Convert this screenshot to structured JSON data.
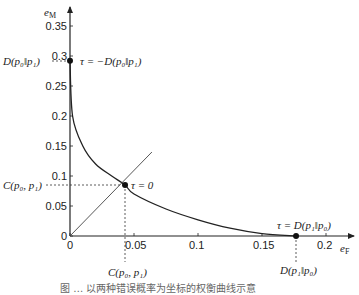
{
  "chart_data": {
    "type": "line",
    "title": "",
    "xlabel": "e_F",
    "ylabel": "e_M",
    "xlim": [
      0,
      0.22
    ],
    "ylim": [
      0,
      0.38
    ],
    "grid": false,
    "x_ticks": [
      0,
      0.05,
      0.1,
      0.15,
      0.2
    ],
    "y_ticks": [
      0,
      0.05,
      0.1,
      0.15,
      0.2,
      0.25,
      0.3,
      0.35
    ],
    "x_tick_labels": [
      "0",
      "0.05",
      "0.1",
      "0.15",
      "0.2"
    ],
    "y_tick_labels": [
      "0",
      "0.05",
      "0.1",
      "0.15",
      "0.2",
      "0.25",
      "0.3",
      "0.35"
    ],
    "series": [
      {
        "name": "tradeoff-curve",
        "x": [
          0,
          0.002,
          0.01,
          0.02,
          0.0326,
          0.043,
          0.05,
          0.075,
          0.1,
          0.125,
          0.15,
          0.1766
        ],
        "y": [
          0.292,
          0.2,
          0.15,
          0.12,
          0.1,
          0.085,
          0.07,
          0.045,
          0.027,
          0.013,
          0.004,
          0
        ]
      },
      {
        "name": "diagonal-eM-equals-eF",
        "x": [
          0,
          0.064
        ],
        "y": [
          0,
          0.14
        ]
      }
    ],
    "points": [
      {
        "name": "tau-minus-D",
        "x": 0,
        "y": 0.292,
        "label": "τ = −D(p₀‖p₁)"
      },
      {
        "name": "tau-zero",
        "x": 0.043,
        "y": 0.085,
        "label": "τ = 0"
      },
      {
        "name": "tau-plus-D",
        "x": 0.1766,
        "y": 0,
        "label": "τ = D(p₁‖p₀)"
      }
    ],
    "annotations": [
      {
        "text": "D(p₀‖p₁)",
        "position": "y-axis at 0.292"
      },
      {
        "text": "C(p₀, p₁)",
        "position": "y-axis at 0.085"
      },
      {
        "text": "C(p₀, p₁)",
        "position": "x-axis at 0.043"
      },
      {
        "text": "D(p₁‖p₀)",
        "position": "x-axis at 0.1766"
      }
    ]
  },
  "labels": {
    "xlabel_main": "e",
    "xlabel_sub": "F",
    "ylabel_main": "e",
    "ylabel_sub": "M",
    "tau_minus": "τ = −D(p₀‖p₁)",
    "tau_zero": "τ = 0",
    "tau_plus": "τ = D(p₁‖p₀)",
    "d01_y": "D(p₀‖p₁)",
    "c_y": "C(p₀, p₁)",
    "c_x": "C(p₀, p₁)",
    "d10_x": "D(p₁‖p₀)"
  },
  "caption": "图 … 以两种错误概率为坐标的权衡曲线示意"
}
